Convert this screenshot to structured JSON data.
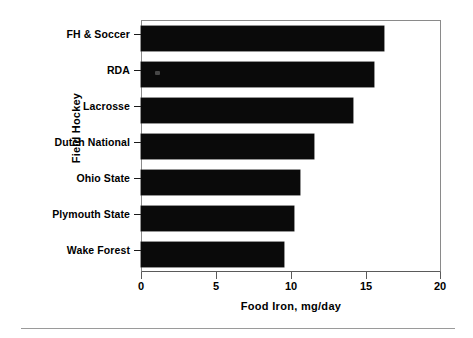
{
  "chart_data": {
    "type": "bar",
    "orientation": "horizontal",
    "title": "",
    "subtitle": "",
    "xlabel": "Food Iron,  mg/day",
    "ylabel": "Field Hockey",
    "categories": [
      "FH & Soccer",
      "RDA",
      "Lacrosse",
      "Dutch National",
      "Ohio State",
      "Plymouth State",
      "Wake Forest"
    ],
    "values": [
      16.2,
      15.5,
      14.1,
      11.5,
      10.6,
      10.2,
      9.5
    ],
    "xlim": [
      0,
      20
    ],
    "xticks": [
      0,
      5,
      10,
      15,
      20
    ],
    "xtick_labels": [
      "0",
      "5",
      "10",
      "15",
      "20"
    ],
    "grid": false,
    "legend": false,
    "legend_position": "none",
    "bar_color": "#0a0a0a",
    "frame_color": "#8a8a8a",
    "series": [
      {
        "name": "Food Iron",
        "values": [
          16.2,
          15.5,
          14.1,
          11.5,
          10.6,
          10.2,
          9.5
        ]
      }
    ],
    "annotations": []
  },
  "figure": {
    "background_color": "#ffffff",
    "footer_rule_color": "#9a9a9a"
  },
  "icons": {
    "bar_speck": "speck-artifact-icon"
  }
}
